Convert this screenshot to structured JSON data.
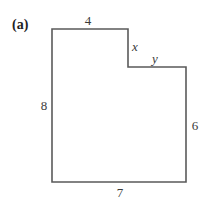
{
  "figure": {
    "panel_label": "(a)",
    "shape": "L-shaped polygon (rectilinear)",
    "line_color": "#555555",
    "sides": {
      "top": "4",
      "notch_vertical": "x",
      "notch_horizontal": "y",
      "left": "8",
      "right": "6",
      "bottom": "7"
    }
  }
}
